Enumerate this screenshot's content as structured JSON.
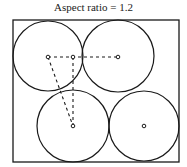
{
  "title": "Aspect ratio = 1.2",
  "diagram": {
    "container": {
      "x": 13,
      "y": 20,
      "width": 166,
      "height": 142,
      "aspect_ratio": 1.2
    },
    "circles": [
      {
        "name": "top-left",
        "cx": 48,
        "cy": 56,
        "r": 35
      },
      {
        "name": "top-right",
        "cx": 118,
        "cy": 56,
        "r": 36
      },
      {
        "name": "bottom-left",
        "cx": 73,
        "cy": 126,
        "r": 36
      },
      {
        "name": "bottom-right",
        "cx": 144,
        "cy": 126,
        "r": 35
      }
    ],
    "points": [
      {
        "name": "top-left-center",
        "x": 48,
        "y": 57
      },
      {
        "name": "top-mid-point",
        "x": 73,
        "y": 57
      },
      {
        "name": "top-right-center",
        "x": 118,
        "y": 57
      },
      {
        "name": "bottom-left-center",
        "x": 73,
        "y": 126
      },
      {
        "name": "bottom-right-center",
        "x": 144,
        "y": 126
      }
    ],
    "dashed_lines": [
      {
        "from": "top-left-center",
        "to": "top-right-center"
      },
      {
        "from": "top-left-center",
        "to": "bottom-left-center"
      },
      {
        "from": "top-mid-point",
        "to": "bottom-left-center"
      }
    ],
    "stroke_color": "#1a1a1a"
  }
}
